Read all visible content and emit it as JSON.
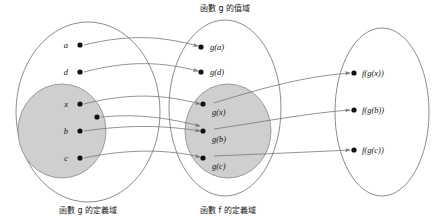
{
  "diagram": {
    "title_top": "函數 g 的值域",
    "caption_left": "函數 g 的定義域",
    "caption_middle": "函數 f 的定義域",
    "colors": {
      "subset_fill": "#cfcfcf",
      "outline": "#6e6e6e",
      "arrow": "#77777d",
      "dot": "#111111"
    },
    "sets": {
      "domain_g": {
        "caption": "函數 g 的定義域",
        "elements": [
          {
            "label": "a",
            "x": 78,
            "y": 45,
            "in_subset": false
          },
          {
            "label": "d",
            "x": 78,
            "y": 72,
            "in_subset": false
          },
          {
            "label": "x",
            "x": 78,
            "y": 104,
            "in_subset": true
          },
          {
            "label": "",
            "x": 95,
            "y": 117,
            "in_subset": true
          },
          {
            "label": "b",
            "x": 78,
            "y": 131,
            "in_subset": true
          },
          {
            "label": "c",
            "x": 78,
            "y": 158,
            "in_subset": true
          }
        ]
      },
      "domain_f": {
        "caption": "函數 f 的定義域",
        "range_caption": "函數 g 的值域",
        "elements": [
          {
            "label": "g(a)",
            "x": 205,
            "y": 47,
            "in_subset": false
          },
          {
            "label": "g(d)",
            "x": 205,
            "y": 72,
            "in_subset": false
          },
          {
            "label": "g(x)",
            "x": 207,
            "y": 105,
            "in_subset": true
          },
          {
            "label": "g(b)",
            "x": 207,
            "y": 131,
            "in_subset": true
          },
          {
            "label": "g(c)",
            "x": 207,
            "y": 158,
            "in_subset": true
          }
        ]
      },
      "codomain_f": {
        "elements": [
          {
            "label": "f(g(x))",
            "x": 357,
            "y": 73
          },
          {
            "label": "f(g(b))",
            "x": 357,
            "y": 110
          },
          {
            "label": "f(g(c))",
            "x": 357,
            "y": 150
          }
        ]
      }
    },
    "mappings_g": [
      {
        "from": "a",
        "to": "g(a)"
      },
      {
        "from": "d",
        "to": "g(d)"
      },
      {
        "from": "x",
        "to": "g(x)"
      },
      {
        "from": "unlabeled",
        "to": "g(b)"
      },
      {
        "from": "b",
        "to": "g(b)"
      },
      {
        "from": "c",
        "to": "g(c)"
      }
    ],
    "mappings_f": [
      {
        "from": "g(x)",
        "to": "f(g(x))"
      },
      {
        "from": "g(b)",
        "to": "f(g(b))"
      },
      {
        "from": "g(c)",
        "to": "f(g(c))"
      }
    ]
  }
}
